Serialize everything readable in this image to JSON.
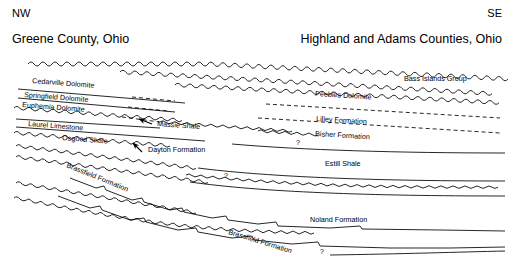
{
  "figure": {
    "type": "stratigraphic-cross-section",
    "orientation_left": "NW",
    "orientation_right": "SE",
    "location_left": "Greene County, Ohio",
    "location_right": "Highland and Adams Counties, Ohio",
    "line_color": "#000000",
    "background_color": "#ffffff"
  },
  "labels": {
    "cedarville": "Cedarville Dolomite",
    "springfield": "Springfield Dolomite",
    "euphemia": "Euphemia Dolomite",
    "laurel": "Laurel Limestone",
    "osgood": "Osgood Shale",
    "massie": "Massie Shale",
    "dayton": "Dayton Formation",
    "brassfield_left": "Brassfield Formation",
    "brassfield_right": "Brassfield Formation",
    "bass_islands": "Bass Islands Group",
    "peebles": "Peebles Dolomite",
    "lilley": "Lilley Formation",
    "bisher": "Bisher Formation",
    "estill": "Estill Shale",
    "noland": "Noland Formation"
  },
  "queries": {
    "q1": "?",
    "q2": "?",
    "q3": "?"
  }
}
